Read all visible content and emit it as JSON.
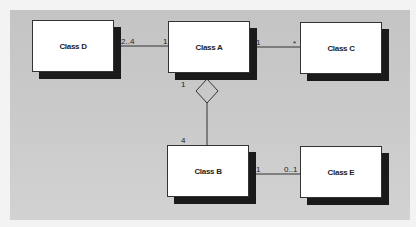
{
  "diagram": {
    "type": "UML class diagram",
    "classes": [
      {
        "id": "D",
        "label": "Class D"
      },
      {
        "id": "A",
        "label": "Class A"
      },
      {
        "id": "C",
        "label": "Class C"
      },
      {
        "id": "B",
        "label": "Class B"
      },
      {
        "id": "E",
        "label": "Class E"
      }
    ],
    "associations": [
      {
        "from": "D",
        "to": "A",
        "from_mult": "2..4",
        "to_mult": "1",
        "kind": "association"
      },
      {
        "from": "A",
        "to": "C",
        "from_mult": "1",
        "to_mult": "*",
        "kind": "association"
      },
      {
        "from": "A",
        "to": "B",
        "from_mult": "1",
        "to_mult": "4",
        "kind": "aggregation",
        "diamond_at": "A"
      },
      {
        "from": "B",
        "to": "E",
        "from_mult": "1",
        "to_mult": "0..1",
        "kind": "association"
      }
    ],
    "colors": {
      "background": "#c8c8c8",
      "box_fill": "#ffffff",
      "shadow": "#1a1a1a",
      "line": "#333333"
    }
  }
}
